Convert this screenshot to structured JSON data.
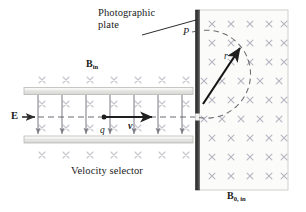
{
  "figure": {
    "title_text": "",
    "background": "#ffffff",
    "labels": {
      "photographic_plate_line1": "Photographic",
      "photographic_plate_line2": "plate",
      "velocity_selector": "Velocity selector",
      "b_in_symbol": "B",
      "b_in_subscript": "in",
      "b0_in_symbol": "B",
      "b0_in_subscript": "0, in",
      "electric_field": "E",
      "charge": "q",
      "velocity": "v",
      "point_p": "P",
      "radius": "r"
    },
    "colors": {
      "plate_dark": "#3a3a3a",
      "plate_light": "#8f8f8f",
      "capacitor_face": "#e8e8e6",
      "capacitor_edge": "#b9b9b5",
      "field_region_fill": "#fbfbfa",
      "field_region_border": "#c9c9c6",
      "cross_light": "#c4c4cb",
      "cross_dense": "#b6b6c2",
      "arrow_dark": "#333333",
      "efield_arrow": "#7d7d86",
      "dashed_trajectory": "#6b6b73",
      "leader_line": "#1a1a1a"
    },
    "geometry": {
      "left_field_crosses_rows": 4,
      "left_field_crosses_cols": 7,
      "right_field_crosses_rows": 9,
      "right_field_crosses_cols": 5,
      "efield_arrow_count": 7,
      "photographic_plate_x": 196,
      "photographic_plate_top": 10,
      "photographic_plate_bottom": 190,
      "field_region_x0": 196,
      "field_region_x1": 288,
      "capacitor_top_y": 88,
      "capacitor_bottom_y": 140,
      "capacitor_x0": 24,
      "capacitor_x1": 193,
      "beam_axis_y": 117,
      "arc_center_x": 198,
      "arc_center_y": 73,
      "arc_radius": 44
    }
  }
}
